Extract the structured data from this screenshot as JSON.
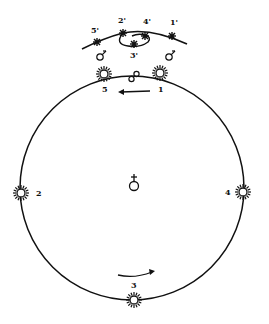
{
  "diagram": {
    "type": "geocentric retrograde motion of Mars",
    "center_symbol": "earth-icon",
    "sun_positions": [
      {
        "label": "1",
        "x": 160,
        "y": 73
      },
      {
        "label": "2",
        "x": 21,
        "y": 193
      },
      {
        "label": "3",
        "x": 134,
        "y": 300
      },
      {
        "label": "4",
        "x": 243,
        "y": 192
      },
      {
        "label": "5",
        "x": 104,
        "y": 74
      }
    ],
    "mars_apparent_positions": [
      {
        "label": "1'",
        "x": 172,
        "y": 36
      },
      {
        "label": "2'",
        "x": 123,
        "y": 33
      },
      {
        "label": "3'",
        "x": 134,
        "y": 44
      },
      {
        "label": "4'",
        "x": 145,
        "y": 36
      },
      {
        "label": "5'",
        "x": 97,
        "y": 42
      }
    ],
    "labels": {
      "s1": "1",
      "s2": "2",
      "s3": "3",
      "s4": "4",
      "s5": "5",
      "m1": "1'",
      "m2": "2'",
      "m3": "3'",
      "m4": "4'",
      "m5": "5'"
    },
    "colors": {
      "ink": "#111111",
      "background": "#ffffff"
    }
  }
}
